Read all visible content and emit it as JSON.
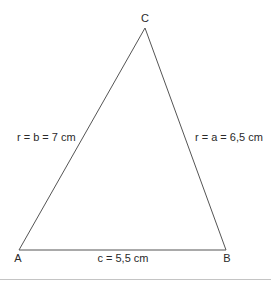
{
  "diagram": {
    "type": "triangle",
    "vertices": [
      {
        "name": "A",
        "x": 19,
        "y": 250
      },
      {
        "name": "B",
        "x": 226,
        "y": 250
      },
      {
        "name": "C",
        "x": 145,
        "y": 28
      }
    ],
    "vertex_labels": {
      "a": "A",
      "b": "B",
      "c": "C"
    },
    "side_labels": {
      "left": "r = b = 7 cm",
      "right": "r = a = 6,5 cm",
      "bottom": "c = 5,5 cm"
    },
    "line_color": "#555555",
    "separator_color": "#bbbbbb"
  }
}
